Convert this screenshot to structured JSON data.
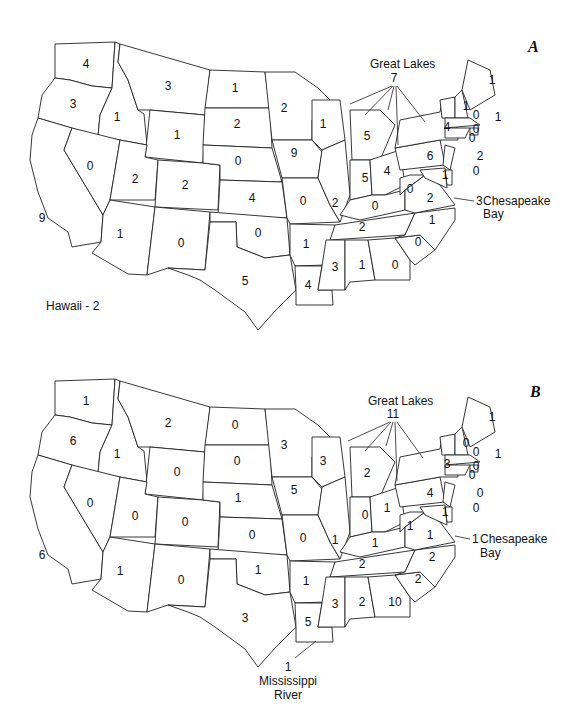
{
  "figure": {
    "panels": [
      {
        "id": "A",
        "label": "A",
        "counts": {
          "WA": "4",
          "OR": "3",
          "CA": "9",
          "ID": "1",
          "NV": "0",
          "MT": "3",
          "WY": "1",
          "UT": "2",
          "CO": "2",
          "AZ": "1",
          "NM": "0",
          "ND": "1",
          "SD": "2",
          "NE": "0",
          "KS": "4",
          "OK": "0",
          "TX": "5",
          "MN": "2",
          "IA": "9",
          "MO": "0",
          "AR": "1",
          "LA": "4",
          "WI": "1",
          "IL": "2",
          "MI": "5",
          "IN": "5",
          "OH": "4",
          "KY": "0",
          "TN": "2",
          "MS": "3",
          "AL": "1",
          "GA": "0",
          "FL": "7",
          "SC": "0",
          "NC": "1",
          "VA": "2",
          "WV": "0",
          "PA": "6",
          "NY": "4",
          "VT": "1",
          "NH": "0",
          "ME": "1",
          "MA": "0",
          "RI": "1",
          "CT": "0",
          "NJ": "2",
          "DE": "0",
          "MD": "1"
        },
        "annotations": {
          "great_lakes_label": "Great Lakes",
          "great_lakes_count": "7",
          "chesapeake_count": "3",
          "chesapeake_label_1": "Chesapeake",
          "chesapeake_label_2": "Bay",
          "hawaii": "Hawaii - 2"
        }
      },
      {
        "id": "B",
        "label": "B",
        "counts": {
          "WA": "1",
          "OR": "6",
          "CA": "6",
          "ID": "1",
          "NV": "0",
          "MT": "2",
          "WY": "0",
          "UT": "0",
          "CO": "0",
          "AZ": "1",
          "NM": "0",
          "ND": "0",
          "SD": "0",
          "NE": "1",
          "KS": "0",
          "OK": "1",
          "TX": "3",
          "MN": "3",
          "IA": "5",
          "MO": "0",
          "AR": "1",
          "LA": "5",
          "WI": "3",
          "IL": "1",
          "MI": "2",
          "IN": "0",
          "OH": "1",
          "KY": "1",
          "TN": "2",
          "MS": "3",
          "AL": "2",
          "GA": "10",
          "FL": "9",
          "SC": "2",
          "NC": "2",
          "VA": "1",
          "WV": "1",
          "PA": "4",
          "NY": "3",
          "VT": "0",
          "NH": "0",
          "ME": "1",
          "MA": "0",
          "RI": "1",
          "CT": "0",
          "NJ": "0",
          "DE": "0",
          "MD": "1"
        },
        "annotations": {
          "great_lakes_label": "Great Lakes",
          "great_lakes_count": "11",
          "chesapeake_count": "1",
          "chesapeake_label_1": "Chesapeake",
          "chesapeake_label_2": "Bay",
          "mississippi_count": "1",
          "mississippi_label_1": "Mississippi",
          "mississippi_label_2": "River"
        }
      }
    ]
  }
}
